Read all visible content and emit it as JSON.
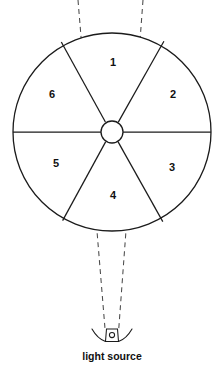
{
  "figure": {
    "caption": "light source",
    "colors": {
      "line": "#1b1b1b",
      "dashed_ray": "#4a4a4a",
      "background": "#ffffff",
      "label_text": "#111111"
    }
  },
  "wheel": {
    "name": "sectored-wheel",
    "center": {
      "x": 112,
      "y": 132
    },
    "outer_radius": 99,
    "hub_radius": 11,
    "sectors": [
      {
        "id": 1,
        "label": "1",
        "label_x": 113,
        "label_y": 63
      },
      {
        "id": 2,
        "label": "2",
        "label_x": 173,
        "label_y": 95
      },
      {
        "id": 3,
        "label": "3",
        "label_x": 172,
        "label_y": 168
      },
      {
        "id": 4,
        "label": "4",
        "label_x": 113,
        "label_y": 196
      },
      {
        "id": 5,
        "label": "5",
        "label_x": 56,
        "label_y": 164
      },
      {
        "id": 6,
        "label": "6",
        "label_x": 52,
        "label_y": 95
      }
    ]
  },
  "light_source": {
    "name": "light-source",
    "caption": "light source",
    "caption_x": 112,
    "caption_y": 357,
    "bulb_x": 112,
    "bulb_y": 336
  },
  "rays": {
    "name": "light-cone-rays",
    "count": 2,
    "style": "dashed",
    "left_top_x": 78,
    "right_top_x": 143,
    "apex_y": 330
  }
}
